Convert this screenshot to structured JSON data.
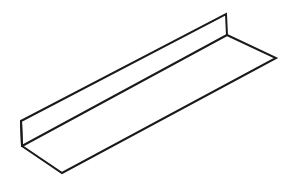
{
  "document": {
    "title": "L-Angle Isometric Line Drawing",
    "kind": "technical-line-drawing",
    "subject": "L-shaped angle bracket / shelf profile in isometric view",
    "background_color": "#ffffff",
    "stroke_color": "#1a1a1a",
    "fill_color": "#ffffff",
    "stroke_width": 2,
    "canvas": {
      "width": 288,
      "height": 190
    }
  },
  "geometry": {
    "units": "pixels",
    "vertices": {
      "back_top_far": {
        "label": "back-top-far",
        "x": 226,
        "y": 14
      },
      "back_top_near": {
        "label": "back-top-near",
        "x": 21,
        "y": 121
      },
      "fold_near": {
        "label": "fold-near",
        "x": 22,
        "y": 146
      },
      "fold_far": {
        "label": "fold-far",
        "x": 227,
        "y": 35
      },
      "front_right": {
        "label": "front-right",
        "x": 276,
        "y": 58
      },
      "front_bottom": {
        "label": "front-bottom",
        "x": 62,
        "y": 173
      }
    },
    "faces": [
      {
        "name": "vertical-back-web",
        "points": "21,121 226,14 227,35 22,146"
      },
      {
        "name": "horizontal-base-flange",
        "points": "22,146 227,35 276,58 62,173"
      }
    ],
    "edges": [
      {
        "name": "back-top-edge",
        "from": "back_top_near",
        "to": "back_top_far"
      },
      {
        "name": "back-right-end-edge",
        "from": "back_top_far",
        "to": "fold_far"
      },
      {
        "name": "interior-fold-line",
        "from": "fold_far",
        "to": "fold_near"
      },
      {
        "name": "back-left-end-edge",
        "from": "fold_near",
        "to": "back_top_near"
      },
      {
        "name": "base-right-end-edge",
        "from": "fold_far",
        "to": "front_right"
      },
      {
        "name": "base-front-edge",
        "from": "front_right",
        "to": "front_bottom"
      },
      {
        "name": "base-left-end-edge",
        "from": "front_bottom",
        "to": "fold_near"
      }
    ],
    "outer_silhouette": "21,121 226,14 227,35 276,58 62,173 22,146"
  }
}
